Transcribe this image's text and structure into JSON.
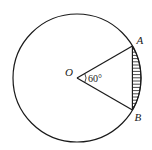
{
  "diagram": {
    "type": "circle-segment",
    "center_label": "O",
    "points": {
      "A": "A",
      "B": "B"
    },
    "central_angle_deg": 60,
    "angle_label": "60°",
    "shaded_region": "segment between chord AB and arc AB",
    "colors": {
      "stroke": "#1a1a1a",
      "hatch": "#1a1a1a",
      "background": "#ffffff"
    }
  }
}
